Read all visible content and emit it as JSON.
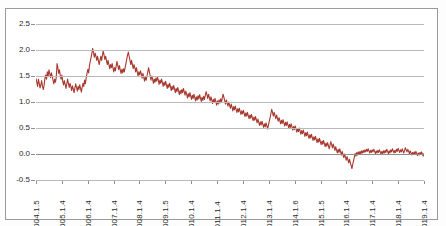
{
  "caption": "",
  "chart_data": {
    "type": "line",
    "title": "",
    "subtitle": "",
    "xlabel": "",
    "ylabel": "",
    "grid": true,
    "legend": false,
    "line_color": "#a8392f",
    "ylim": [
      -0.5,
      2.5
    ],
    "yticks": [
      "2.5",
      "2.0",
      "1.5",
      "1.0",
      "0.5",
      "0.0",
      "-0.5"
    ],
    "ytick_values": [
      2.5,
      2.0,
      1.5,
      1.0,
      0.5,
      0.0,
      -0.5
    ],
    "xticks": [
      "2004.1.5",
      "2005.1.4",
      "2006.1.4",
      "2007.1.4",
      "2008.1.4",
      "2009.1.5",
      "2010.1.4",
      "2011.1.4",
      "2012.1.4",
      "2013.1.4",
      "2014.1.6",
      "2015.1.5",
      "2016.1.4",
      "2017.1.4",
      "2018.1.4",
      "2019.1.4"
    ],
    "series": [
      {
        "name": "spread",
        "values": [
          1.45,
          1.38,
          1.3,
          1.44,
          1.36,
          1.27,
          1.33,
          1.41,
          1.3,
          1.24,
          1.32,
          1.45,
          1.52,
          1.44,
          1.58,
          1.49,
          1.62,
          1.55,
          1.47,
          1.56,
          1.5,
          1.42,
          1.35,
          1.44,
          1.38,
          1.47,
          1.74,
          1.66,
          1.55,
          1.62,
          1.5,
          1.44,
          1.52,
          1.4,
          1.33,
          1.41,
          1.34,
          1.26,
          1.35,
          1.44,
          1.36,
          1.28,
          1.36,
          1.3,
          1.22,
          1.31,
          1.25,
          1.18,
          1.27,
          1.35,
          1.28,
          1.21,
          1.3,
          1.24,
          1.33,
          1.26,
          1.19,
          1.28,
          1.36,
          1.3,
          1.42,
          1.35,
          1.47,
          1.55,
          1.63,
          1.56,
          1.7,
          1.78,
          1.86,
          1.94,
          2.03,
          1.95,
          1.86,
          1.94,
          1.88,
          1.8,
          1.88,
          1.8,
          1.72,
          1.8,
          1.88,
          1.8,
          1.9,
          1.98,
          1.9,
          1.82,
          1.88,
          1.8,
          1.72,
          1.8,
          1.72,
          1.64,
          1.72,
          1.66,
          1.74,
          1.66,
          1.58,
          1.66,
          1.6,
          1.7,
          1.78,
          1.7,
          1.62,
          1.7,
          1.62,
          1.55,
          1.63,
          1.56,
          1.64,
          1.58,
          1.66,
          1.74,
          1.82,
          1.9,
          1.96,
          1.88,
          1.8,
          1.72,
          1.8,
          1.72,
          1.64,
          1.72,
          1.66,
          1.58,
          1.66,
          1.58,
          1.5,
          1.58,
          1.52,
          1.6,
          1.54,
          1.46,
          1.55,
          1.48,
          1.4,
          1.48,
          1.42,
          1.5,
          1.58,
          1.66,
          1.58,
          1.5,
          1.42,
          1.5,
          1.44,
          1.36,
          1.44,
          1.38,
          1.46,
          1.4,
          1.48,
          1.42,
          1.34,
          1.42,
          1.36,
          1.44,
          1.38,
          1.3,
          1.38,
          1.32,
          1.4,
          1.33,
          1.26,
          1.34,
          1.28,
          1.36,
          1.3,
          1.22,
          1.3,
          1.24,
          1.32,
          1.25,
          1.18,
          1.26,
          1.2,
          1.28,
          1.22,
          1.14,
          1.22,
          1.16,
          1.24,
          1.18,
          1.26,
          1.2,
          1.13,
          1.21,
          1.15,
          1.08,
          1.16,
          1.1,
          1.18,
          1.12,
          1.05,
          1.13,
          1.07,
          1.15,
          1.09,
          1.02,
          1.1,
          1.04,
          1.12,
          1.06,
          1.14,
          1.08,
          1.01,
          1.09,
          1.03,
          1.11,
          1.05,
          1.13,
          1.2,
          1.14,
          1.07,
          1.15,
          1.09,
          1.02,
          1.1,
          1.04,
          0.97,
          1.05,
          0.99,
          1.07,
          1.01,
          0.94,
          1.02,
          0.96,
          1.04,
          0.98,
          1.06,
          1.0,
          1.08,
          1.15,
          1.09,
          1.02,
          0.96,
          1.04,
          0.98,
          0.92,
          1.0,
          0.94,
          0.88,
          0.96,
          0.9,
          0.83,
          0.91,
          0.85,
          0.92,
          0.86,
          0.8,
          0.87,
          0.81,
          0.88,
          0.82,
          0.76,
          0.83,
          0.77,
          0.84,
          0.78,
          0.72,
          0.79,
          0.73,
          0.8,
          0.74,
          0.68,
          0.75,
          0.69,
          0.76,
          0.7,
          0.64,
          0.71,
          0.65,
          0.72,
          0.66,
          0.6,
          0.67,
          0.61,
          0.55,
          0.62,
          0.56,
          0.63,
          0.57,
          0.51,
          0.58,
          0.52,
          0.6,
          0.54,
          0.48,
          0.56,
          0.63,
          0.7,
          0.78,
          0.86,
          0.8,
          0.73,
          0.8,
          0.74,
          0.68,
          0.75,
          0.69,
          0.63,
          0.7,
          0.64,
          0.58,
          0.65,
          0.59,
          0.66,
          0.6,
          0.54,
          0.61,
          0.55,
          0.62,
          0.56,
          0.5,
          0.57,
          0.51,
          0.58,
          0.52,
          0.46,
          0.53,
          0.47,
          0.54,
          0.48,
          0.42,
          0.49,
          0.43,
          0.5,
          0.44,
          0.38,
          0.45,
          0.39,
          0.46,
          0.4,
          0.34,
          0.41,
          0.35,
          0.42,
          0.36,
          0.3,
          0.37,
          0.31,
          0.38,
          0.32,
          0.26,
          0.33,
          0.27,
          0.34,
          0.28,
          0.22,
          0.29,
          0.23,
          0.3,
          0.24,
          0.18,
          0.25,
          0.19,
          0.26,
          0.2,
          0.14,
          0.21,
          0.15,
          0.22,
          0.16,
          0.1,
          0.17,
          0.24,
          0.18,
          0.12,
          0.19,
          0.13,
          0.07,
          0.14,
          0.08,
          0.02,
          0.09,
          0.03,
          0.1,
          0.04,
          -0.02,
          0.05,
          -0.01,
          -0.07,
          0.0,
          -0.06,
          -0.12,
          -0.05,
          -0.11,
          -0.17,
          -0.1,
          -0.16,
          -0.22,
          -0.28,
          -0.2,
          -0.13,
          -0.06,
          0.01,
          -0.04,
          0.03,
          -0.02,
          0.04,
          -0.01,
          0.05,
          0.0,
          0.06,
          0.02,
          0.07,
          0.03,
          0.08,
          0.04,
          0.09,
          0.05,
          0.1,
          0.06,
          0.02,
          0.07,
          0.03,
          0.08,
          0.04,
          0.09,
          0.05,
          0.01,
          0.06,
          0.02,
          0.07,
          0.03,
          0.08,
          0.04,
          0.0,
          0.05,
          0.01,
          0.06,
          0.02,
          0.07,
          0.03,
          0.09,
          0.05,
          0.01,
          0.06,
          0.02,
          0.08,
          0.04,
          0.1,
          0.06,
          0.02,
          0.07,
          0.03,
          0.09,
          0.05,
          0.11,
          0.07,
          0.03,
          0.08,
          0.04,
          0.1,
          0.06,
          0.02,
          0.07,
          0.12,
          0.08,
          0.04,
          0.09,
          0.05,
          0.01,
          0.06,
          0.02,
          -0.02,
          0.03,
          -0.01,
          0.04,
          0.0,
          0.05,
          0.01,
          -0.03,
          0.02,
          -0.02,
          0.03,
          -0.01,
          0.04,
          0.0,
          -0.04,
          0.01
        ]
      }
    ]
  }
}
